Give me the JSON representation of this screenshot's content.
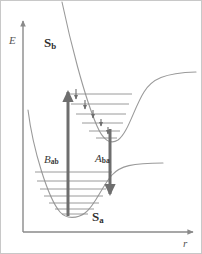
{
  "figure": {
    "kind": "potential-energy-curve-diagram",
    "width": 202,
    "height": 254,
    "background_color": "#ffffff",
    "border_color": "#c8c8c8"
  },
  "axes": {
    "y": {
      "name": "energy-axis",
      "label": "E",
      "label_style": "italic",
      "color": "#8a8a8a",
      "x": 23,
      "top": 18,
      "bottom": 232,
      "arrow": "up"
    },
    "x": {
      "name": "internuclear-distance-axis",
      "label": "r",
      "label_style": "italic",
      "color": "#8a8a8a",
      "y": 232,
      "left": 23,
      "right": 196,
      "arrow": "right"
    }
  },
  "states": {
    "upper": {
      "name": "excited-state-curve",
      "label": "S",
      "subscript": "b",
      "label_full": "Sb",
      "curve_color": "#9a9a9a",
      "minimum_x": 110,
      "minimum_y": 143,
      "plateau_y": 73,
      "level_color": "#8f8f8f",
      "levels": [
        {
          "index": 5,
          "y": 94,
          "x1": 67,
          "x2": 132
        },
        {
          "index": 4,
          "y": 104,
          "x1": 71,
          "x2": 129
        },
        {
          "index": 3,
          "y": 114,
          "x1": 76,
          "x2": 126
        },
        {
          "index": 2,
          "y": 123,
          "x1": 82,
          "x2": 123
        },
        {
          "index": 1,
          "y": 131,
          "x1": 89,
          "x2": 120
        },
        {
          "index": 0,
          "y": 138,
          "x1": 96,
          "x2": 117
        }
      ]
    },
    "lower": {
      "name": "ground-state-curve",
      "label": "S",
      "subscript": "a",
      "label_full": "Sa",
      "curve_color": "#9a9a9a",
      "minimum_x": 75,
      "minimum_y": 215,
      "plateau_y": 163,
      "level_color": "#8f8f8f",
      "levels": [
        {
          "index": 6,
          "y": 172,
          "x1": 35,
          "x2": 112
        },
        {
          "index": 5,
          "y": 181,
          "x1": 37,
          "x2": 109
        },
        {
          "index": 4,
          "y": 189,
          "x1": 40,
          "x2": 106
        },
        {
          "index": 3,
          "y": 196,
          "x1": 44,
          "x2": 103
        },
        {
          "index": 2,
          "y": 203,
          "x1": 49,
          "x2": 99
        },
        {
          "index": 1,
          "y": 209,
          "x1": 55,
          "x2": 94
        },
        {
          "index": 0,
          "y": 214,
          "x1": 62,
          "x2": 88
        }
      ]
    }
  },
  "transitions": {
    "absorption": {
      "name": "absorption-arrow",
      "label": "B",
      "subscript": "ab",
      "label_full": "Bab",
      "direction": "up",
      "color": "#6e6e6e",
      "x": 68,
      "y_start": 216,
      "y_end": 90,
      "thickness": 3
    },
    "emission": {
      "name": "emission-arrow",
      "label": "A",
      "subscript": "ba",
      "label_full": "Aba",
      "direction": "down",
      "color": "#6e6e6e",
      "x": 110,
      "y_start": 129,
      "y_end": 197,
      "thickness": 3
    },
    "relaxation_cascade": {
      "name": "vibrational-relaxation-arrows",
      "color": "#6e6e6e",
      "arrows": [
        {
          "x": 76,
          "y_start": 89,
          "y_end": 101
        },
        {
          "x": 85,
          "y_start": 100,
          "y_end": 111
        },
        {
          "x": 93,
          "y_start": 110,
          "y_end": 120
        },
        {
          "x": 101,
          "y_start": 119,
          "y_end": 128
        },
        {
          "x": 108,
          "y_start": 127,
          "y_end": 136
        }
      ]
    }
  }
}
